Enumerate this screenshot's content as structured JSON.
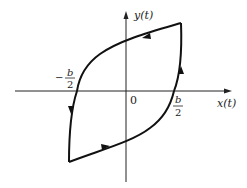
{
  "diagram": {
    "type": "hysteresis-loop",
    "axes": {
      "x_label": "x(t)",
      "y_label": "y(t)",
      "origin_label": "0"
    },
    "ticks": {
      "positive": {
        "sign": "",
        "numerator": "b",
        "denominator": "2"
      },
      "negative": {
        "sign": "−",
        "numerator": "b",
        "denominator": "2"
      }
    },
    "loop": {
      "direction": "counterclockwise",
      "arrows": [
        {
          "position": "upper branch",
          "heading": "left"
        },
        {
          "position": "left vertical side",
          "heading": "down"
        },
        {
          "position": "lower branch",
          "heading": "right"
        },
        {
          "position": "right vertical side",
          "heading": "up"
        }
      ]
    },
    "colors": {
      "stroke": "#111111",
      "background": "#ffffff"
    }
  }
}
